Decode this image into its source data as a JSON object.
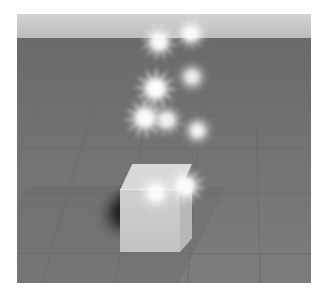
{
  "scene": {
    "title": "3D Particle Effect Scene",
    "description": "Gray grid ground plane with a light cube emitting a rising trail of white star sparkle particles",
    "renderer": "3d-viewport",
    "frame": {
      "image_width": 326,
      "image_height": 295,
      "matte_color": "#ffffff",
      "viewport_x": 17,
      "viewport_y": 14,
      "viewport_width": 294,
      "viewport_height": 269
    },
    "sky": {
      "label": "sky",
      "color_top": "#d2d2d2",
      "color_bottom": "#bdbdbd",
      "height": 24
    },
    "ground": {
      "label": "ground-plane",
      "color_near": "#7d7d7d",
      "color_far": "#6a6a6a",
      "grid_color": "#6c6c6c",
      "grid_visible": true,
      "horizon_y": 24,
      "horizontal_lines": [
        {
          "y": 10,
          "opacity": 0.28
        },
        {
          "y": 21,
          "opacity": 0.33
        },
        {
          "y": 35,
          "opacity": 0.38
        },
        {
          "y": 53,
          "opacity": 0.44
        },
        {
          "y": 77,
          "opacity": 0.5
        },
        {
          "y": 110,
          "opacity": 0.56
        },
        {
          "y": 155,
          "opacity": 0.62
        },
        {
          "y": 215,
          "opacity": 0.68
        }
      ],
      "vanishing_lines": [
        {
          "bottom_x": -130,
          "angle": 27.0
        },
        {
          "bottom_x": -52,
          "angle": 22.0
        },
        {
          "bottom_x": 24,
          "angle": 16.5
        },
        {
          "bottom_x": 98,
          "angle": 10.5
        },
        {
          "bottom_x": 170,
          "angle": 4.5
        },
        {
          "bottom_x": 243,
          "angle": -1.5
        },
        {
          "bottom_x": 316,
          "angle": -7.5
        },
        {
          "bottom_x": 392,
          "angle": -13.5
        },
        {
          "bottom_x": 470,
          "angle": -19.5
        }
      ]
    },
    "cube": {
      "label": "cube",
      "color_top": "#d8d8d8",
      "color_front": "#c8c8c8",
      "color_right": "#b8b8b8",
      "x": 103,
      "y": 150,
      "width": 76,
      "height": 88
    },
    "shadow": {
      "label": "cube-shadow",
      "color": "#121212",
      "x": 68,
      "y": 166,
      "width": 74,
      "height": 62
    },
    "particles": {
      "label": "sparkle-trail",
      "color": "#ffffff",
      "count": 9,
      "points_per_star": 12,
      "items": [
        {
          "id": "sparkle-1",
          "x": 148,
          "y": 151,
          "size": 42,
          "blur": 2.0,
          "opacity": 0.98,
          "rotation": 8,
          "core": 17
        },
        {
          "id": "sparkle-2",
          "x": 120,
          "y": 160,
          "size": 38,
          "blur": 2.2,
          "opacity": 0.95,
          "rotation": -14,
          "core": 15
        },
        {
          "id": "sparkle-3",
          "x": 164,
          "y": 100,
          "size": 33,
          "blur": 2.4,
          "opacity": 0.92,
          "rotation": 22,
          "core": 13
        },
        {
          "id": "sparkle-4",
          "x": 106,
          "y": 82,
          "size": 44,
          "blur": 2.0,
          "opacity": 0.97,
          "rotation": -6,
          "core": 18
        },
        {
          "id": "sparkle-5",
          "x": 132,
          "y": 88,
          "size": 36,
          "blur": 2.3,
          "opacity": 0.9,
          "rotation": 15,
          "core": 14
        },
        {
          "id": "sparkle-6",
          "x": 116,
          "y": 52,
          "size": 45,
          "blur": 1.9,
          "opacity": 0.98,
          "rotation": 3,
          "core": 19
        },
        {
          "id": "sparkle-7",
          "x": 158,
          "y": 46,
          "size": 34,
          "blur": 2.4,
          "opacity": 0.88,
          "rotation": -20,
          "core": 13
        },
        {
          "id": "sparkle-8",
          "x": 122,
          "y": 8,
          "size": 40,
          "blur": 2.1,
          "opacity": 0.96,
          "rotation": 11,
          "core": 16
        },
        {
          "id": "sparkle-9",
          "x": 156,
          "y": 2,
          "size": 36,
          "blur": 2.3,
          "opacity": 0.93,
          "rotation": -9,
          "core": 14
        }
      ]
    }
  }
}
